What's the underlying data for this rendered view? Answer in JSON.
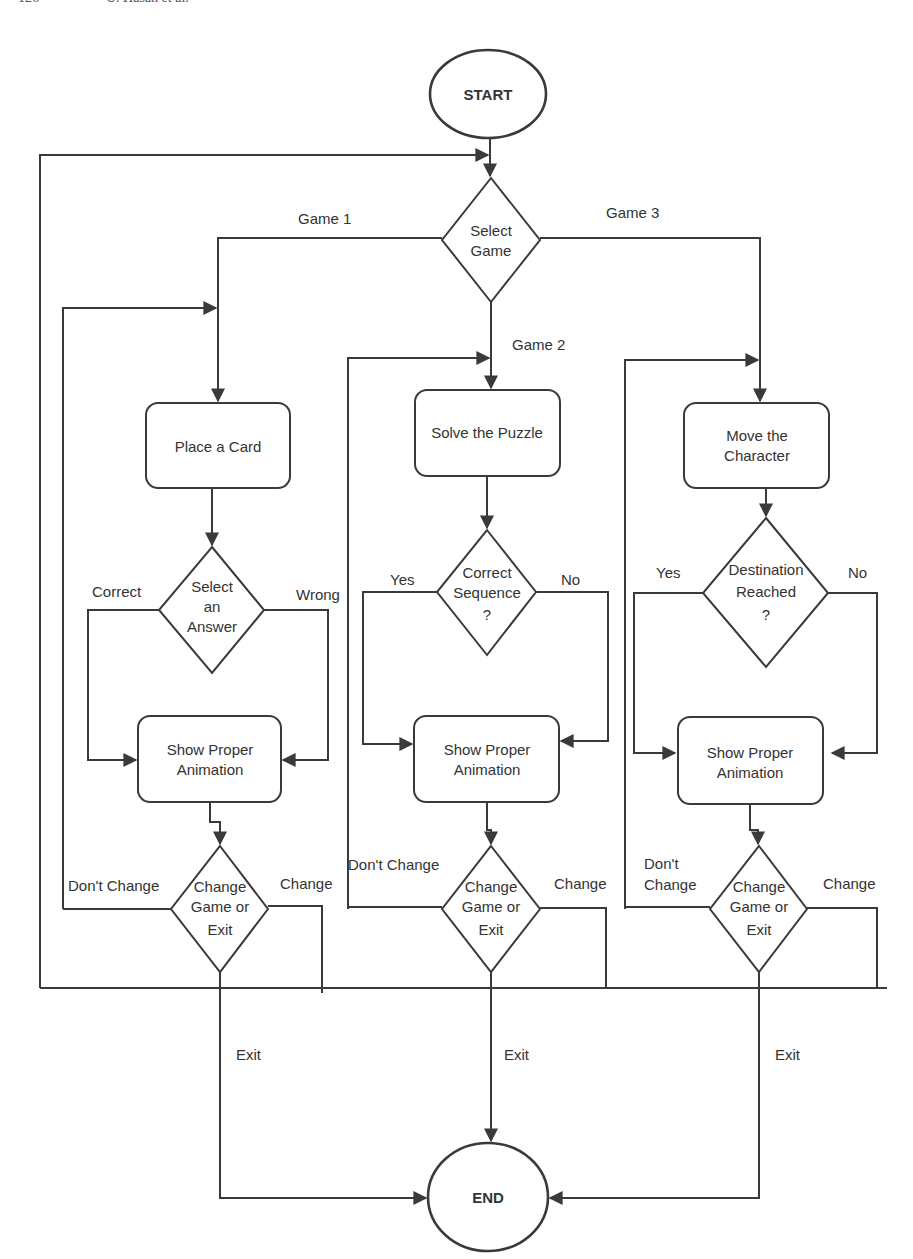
{
  "page_header": {
    "page_number": "126",
    "authors": "U. Hasan et al."
  },
  "diagram": {
    "type": "flowchart",
    "terminals": {
      "start": "START",
      "end": "END"
    },
    "select_game": {
      "lines": [
        "Select",
        "Game"
      ]
    },
    "branches": [
      {
        "id": "game1",
        "label": "Game 1",
        "action": {
          "lines": [
            "Place a Card"
          ]
        },
        "decision": {
          "lines": [
            "Select",
            "an",
            "Answer"
          ],
          "left_label": "Correct",
          "right_label": "Wrong"
        },
        "animation": {
          "lines": [
            "Show Proper",
            "Animation"
          ]
        },
        "exit_decision": {
          "lines": [
            "Change",
            "Game or",
            "Exit"
          ],
          "left_label": [
            "Don't Change"
          ],
          "right_label": "Change",
          "exit_label": "Exit"
        }
      },
      {
        "id": "game2",
        "label": "Game 2",
        "action": {
          "lines": [
            "Solve the Puzzle"
          ]
        },
        "decision": {
          "lines": [
            "Correct",
            "Sequence",
            "?"
          ],
          "left_label": "Yes",
          "right_label": "No"
        },
        "animation": {
          "lines": [
            "Show Proper",
            "Animation"
          ]
        },
        "exit_decision": {
          "lines": [
            "Change",
            "Game or",
            "Exit"
          ],
          "left_label": [
            "Don't Change"
          ],
          "right_label": "Change",
          "exit_label": "Exit"
        }
      },
      {
        "id": "game3",
        "label": "Game 3",
        "action": {
          "lines": [
            "Move the",
            "Character"
          ]
        },
        "decision": {
          "lines": [
            "Destination",
            "Reached",
            "?"
          ],
          "left_label": "Yes",
          "right_label": "No"
        },
        "animation": {
          "lines": [
            "Show Proper",
            "Animation"
          ]
        },
        "exit_decision": {
          "lines": [
            "Change",
            "Game or",
            "Exit"
          ],
          "left_label": [
            "Don't",
            "Change"
          ],
          "right_label": "Change",
          "exit_label": "Exit"
        }
      }
    ],
    "colors": {
      "stroke": "#3a3a3a",
      "text": "#333333",
      "background": "#ffffff"
    }
  }
}
